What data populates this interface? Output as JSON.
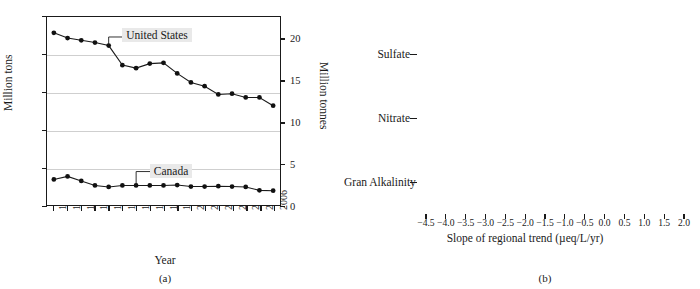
{
  "figure": {
    "panel_a_caption": "(a)",
    "panel_b_caption": "(b)"
  },
  "chart_data": [
    {
      "type": "line",
      "panel": "(a)",
      "title": "",
      "xlabel": "Year",
      "ylabel": "Million tons",
      "ylabel_right": "Million tonnes",
      "x": [
        1990,
        1991,
        1992,
        1993,
        1994,
        1995,
        1996,
        1997,
        1998,
        1999,
        2000,
        2001,
        2002,
        2003,
        2004,
        2005,
        2006
      ],
      "xticks": [
        "1990",
        "1991",
        "1992",
        "1993",
        "1994",
        "1995",
        "1996",
        "1997",
        "1998",
        "1999",
        "2000",
        "2001",
        "2002",
        "2003",
        "2004",
        "2005",
        "2006"
      ],
      "yticks_left": [
        "0",
        "5",
        "10",
        "15",
        "20",
        "25"
      ],
      "ytick_values_left": [
        0,
        5,
        10,
        15,
        20,
        25
      ],
      "ylim_left": [
        0,
        25
      ],
      "yticks_right": [
        "0",
        "5",
        "10",
        "15",
        "20"
      ],
      "ytick_values_right": [
        0,
        5,
        10,
        15,
        20
      ],
      "ylim_right": [
        0,
        22.6796
      ],
      "grid": true,
      "legend_position": "inline-annotations",
      "series": [
        {
          "name": "United States",
          "label": "United States",
          "label_x": 1994.1,
          "label_y": 23.0,
          "values": [
            22.9,
            22.2,
            21.9,
            21.6,
            21.2,
            18.6,
            18.2,
            18.8,
            18.9,
            17.5,
            16.3,
            15.8,
            14.7,
            14.8,
            14.3,
            14.3,
            13.2
          ]
        },
        {
          "name": "Canada",
          "label": "Canada",
          "label_x": 1995.6,
          "label_y": 5.1,
          "values": [
            3.4,
            3.8,
            3.2,
            2.6,
            2.4,
            2.6,
            2.6,
            2.6,
            2.6,
            2.65,
            2.45,
            2.45,
            2.5,
            2.45,
            2.4,
            1.95,
            1.9
          ]
        }
      ]
    },
    {
      "type": "bar",
      "panel": "(b)",
      "orientation": "horizontal",
      "title": "",
      "xlabel": "Slope of regional trend (µeq/L/yr)",
      "ylabel": "",
      "xlim": [
        -4.75,
        2.0
      ],
      "xticks": [
        "−4.5",
        "−4.0",
        "−3.5",
        "−3.0",
        "−2.5",
        "−2.0",
        "−1.5",
        "−1.0",
        "−0.5",
        "0.0",
        "0.5",
        "1.0",
        "1.5",
        "2.0"
      ],
      "xtick_values": [
        -4.5,
        -4.0,
        -3.5,
        -3.0,
        -2.5,
        -2.0,
        -1.5,
        -1.0,
        -0.5,
        0.0,
        0.5,
        1.0,
        1.5,
        2.0
      ],
      "grid": true,
      "legend_position": "inside-left",
      "categories": [
        "Sulfate",
        "Nitrate",
        "Gran Alkalinity"
      ],
      "legend": [
        {
          "label": "New England Lakes (n=31)",
          "color": "#171717"
        },
        {
          "label": "Adirondack Lakes (n=49)",
          "color": "#575757"
        },
        {
          "label": "No. Appalachian Streams (n=9)",
          "color": "#8f8f8f"
        },
        {
          "label": "So. Appalachian Streams (n=71)",
          "color": "#7b7b7b"
        },
        {
          "label": "Atlantic Canada Lakes (n=88)",
          "color": "#cbcbcb"
        },
        {
          "label": "Quebec Lakes (n=28)",
          "color": "#6e6e6e"
        },
        {
          "label": "Sudbury Lakes (n=72)",
          "color": "#232323"
        },
        {
          "label": "Ontario Lakes (n=80)",
          "color": "#b8b8b8"
        }
      ],
      "groups": [
        {
          "category": "Sulfate",
          "bars": [
            {
              "series": "New England Lakes (n=31)",
              "value": -1.42,
              "err_low": -1.78,
              "err_high": -1.13
            },
            {
              "series": "Adirondack Lakes (n=49)",
              "value": -1.82,
              "err_low": -2.22,
              "err_high": -1.48
            },
            {
              "series": "No. Appalachian Streams (n=9)",
              "value": -2.24,
              "err_low": -2.72,
              "err_high": -1.0
            },
            {
              "series": "So. Appalachian Streams (n=71)",
              "value": -0.1,
              "err_low": -0.22,
              "err_high": 0.05
            },
            {
              "series": "Atlantic Canada Lakes (n=88)",
              "value": -0.56,
              "err_low": -0.7,
              "err_high": -0.33
            },
            {
              "series": "Quebec Lakes (n=28)",
              "value": -1.96,
              "err_low": -2.3,
              "err_high": -1.62
            },
            {
              "series": "Sudbury Lakes (n=72)",
              "value": -4.1,
              "err_low": -4.45,
              "err_high": -3.92
            },
            {
              "series": "Ontario Lakes (n=80)",
              "value": -1.72,
              "err_low": -2.25,
              "err_high": -1.33
            }
          ]
        },
        {
          "category": "Nitrate",
          "bars": [
            {
              "series": "New England Lakes (n=31)",
              "value": -0.04,
              "err_low": -0.09,
              "err_high": 0.02
            },
            {
              "series": "Adirondack Lakes (n=49)",
              "value": -0.4,
              "err_low": -0.54,
              "err_high": -0.26
            },
            {
              "series": "No. Appalachian Streams (n=9)",
              "value": -0.24,
              "err_low": -0.62,
              "err_high": -0.07
            },
            {
              "series": "So. Appalachian Streams (n=71)",
              "value": -0.1,
              "err_low": -0.16,
              "err_high": -0.04
            },
            {
              "series": "Atlantic Canada Lakes (n=88)",
              "value": 0.0,
              "err_low": 0.0,
              "err_high": 0.0
            },
            {
              "series": "Quebec Lakes (n=28)",
              "value": 0.0,
              "err_low": 0.0,
              "err_high": 0.0
            },
            {
              "series": "Sudbury Lakes (n=72)",
              "value": -0.05,
              "err_low": -0.07,
              "err_high": -0.03
            },
            {
              "series": "Ontario Lakes (n=80)",
              "value": 0.0,
              "err_low": 0.0,
              "err_high": 0.0
            }
          ]
        },
        {
          "category": "Gran Alkalinity",
          "bars": [
            {
              "series": "New England Lakes (n=31)",
              "value": 0.17,
              "err_low": 0.06,
              "err_high": 0.42
            },
            {
              "series": "Adirondack Lakes (n=49)",
              "value": 0.84,
              "err_low": 0.62,
              "err_high": 1.02
            },
            {
              "series": "No. Appalachian Streams (n=9)",
              "value": 0.78,
              "err_low": 0.28,
              "err_high": 1.42
            },
            {
              "series": "So. Appalachian Streams (n=71)",
              "value": 0.04,
              "err_low": -0.12,
              "err_high": 0.07
            },
            {
              "series": "Atlantic Canada Lakes (n=88)",
              "value": -0.18,
              "err_low": -0.28,
              "err_high": -0.08
            },
            {
              "series": "Quebec Lakes (n=28)",
              "value": 0.3,
              "err_low": 0.06,
              "err_high": 0.58
            },
            {
              "series": "Sudbury Lakes (n=72)",
              "value": 0.86,
              "err_low": 0.62,
              "err_high": 1.04
            },
            {
              "series": "Ontario Lakes (n=80)",
              "value": 0.18,
              "err_low": 0.04,
              "err_high": 0.52
            }
          ]
        }
      ]
    }
  ]
}
